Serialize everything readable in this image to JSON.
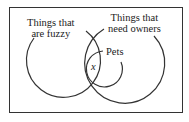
{
  "diagram": {
    "type": "venn",
    "sets": [
      {
        "id": "fuzzy",
        "label_line1": "Things that",
        "label_line2": "are fuzzy"
      },
      {
        "id": "owners",
        "label_line1": "Things that",
        "label_line2": "need owners"
      },
      {
        "id": "pets",
        "label": "Pets"
      }
    ],
    "region_marker": "x",
    "stroke_color": "#333333"
  }
}
